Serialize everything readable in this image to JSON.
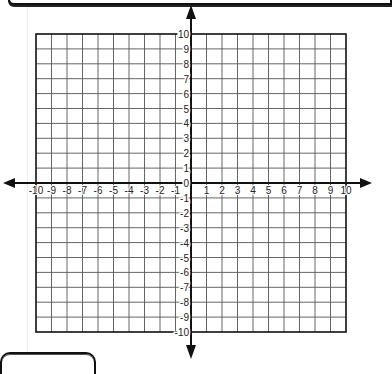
{
  "diagram": {
    "type": "coordinate-plane",
    "x_axis": {
      "min": -10,
      "max": 10,
      "tick_labels": [
        "-10",
        "-9",
        "-8",
        "-7",
        "-6",
        "-5",
        "-4",
        "-3",
        "-2",
        "-1",
        "0",
        "1",
        "2",
        "3",
        "4",
        "5",
        "6",
        "7",
        "8",
        "9",
        "10"
      ]
    },
    "y_axis": {
      "min": -10,
      "max": 10,
      "tick_labels": [
        "10",
        "9",
        "8",
        "7",
        "6",
        "5",
        "4",
        "3",
        "2",
        "1",
        "0",
        "-1",
        "-2",
        "-3",
        "-4",
        "-5",
        "-6",
        "-7",
        "-8",
        "-9",
        "-10"
      ]
    },
    "grid": {
      "cols": 20,
      "rows": 20,
      "line_color": "#555555",
      "border_color": "#111111",
      "axis_color": "#111111"
    }
  }
}
